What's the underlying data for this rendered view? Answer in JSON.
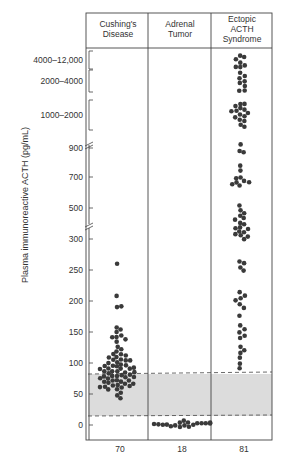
{
  "chart_data": {
    "type": "scatter",
    "title": "",
    "ylabel": "Plasma immunoreactive ACTH (pg/mL)",
    "xlabel": "",
    "categories": [
      "Cushing's Disease",
      "Adrenal Tumor",
      "Ectopic ACTH Syndrome"
    ],
    "category_lines": [
      [
        "Cushing's",
        "Disease"
      ],
      [
        "Adrenal",
        "Tumor"
      ],
      [
        "Ectopic",
        "ACTH",
        "Syndrome"
      ]
    ],
    "counts": [
      "70",
      "18",
      "81"
    ],
    "y_ticks": [
      "0",
      "50",
      "100",
      "150",
      "200",
      "250",
      "300",
      "500",
      "700",
      "900"
    ],
    "y_range_brackets": [
      "1000–2000",
      "2000–4000",
      "4000–12,000"
    ],
    "y_axis_breaks": [
      "between 250-300 scale segments",
      "between 300 and 500",
      "between 900 and 1000"
    ],
    "normal_range": {
      "low": 13,
      "high": 83,
      "style": "gray shaded band with dashed borders"
    },
    "grid": false,
    "series": [
      {
        "name": "Cushing's Disease",
        "n": 70,
        "approx_values": [
          260,
          207,
          190,
          190,
          157,
          155,
          150,
          145,
          142,
          140,
          138,
          135,
          125,
          122,
          118,
          115,
          113,
          112,
          110,
          108,
          106,
          105,
          104,
          103,
          102,
          100,
          98,
          97,
          96,
          95,
          94,
          93,
          92,
          91,
          90,
          89,
          88,
          87,
          86,
          85,
          84,
          83,
          82,
          81,
          80,
          79,
          78,
          77,
          76,
          75,
          74,
          73,
          72,
          71,
          70,
          69,
          68,
          67,
          66,
          65,
          64,
          63,
          62,
          61,
          60,
          58,
          56,
          52,
          48,
          43
        ]
      },
      {
        "name": "Adrenal Tumor",
        "n": 18,
        "approx_values": [
          5,
          4,
          3,
          3,
          2,
          2,
          1,
          1,
          0,
          0,
          0,
          -1,
          -1,
          -2,
          -2,
          -3,
          -3,
          -4
        ]
      },
      {
        "name": "Ectopic ACTH Syndrome",
        "n": 81,
        "approx_values": [
          10000,
          9000,
          8000,
          7000,
          6000,
          5000,
          4500,
          3800,
          3500,
          3200,
          3000,
          2800,
          2500,
          2200,
          2100,
          1900,
          1850,
          1800,
          1750,
          1700,
          1650,
          1600,
          1550,
          1500,
          1450,
          1400,
          1350,
          1300,
          1200,
          1100,
          920,
          880,
          870,
          780,
          740,
          700,
          690,
          680,
          670,
          660,
          650,
          640,
          520,
          480,
          470,
          450,
          430,
          420,
          400,
          390,
          380,
          370,
          360,
          350,
          340,
          330,
          320,
          310,
          300,
          265,
          260,
          255,
          250,
          215,
          210,
          205,
          200,
          195,
          190,
          175,
          160,
          155,
          150,
          145,
          140,
          125,
          120,
          115,
          110,
          100,
          92
        ]
      }
    ]
  }
}
